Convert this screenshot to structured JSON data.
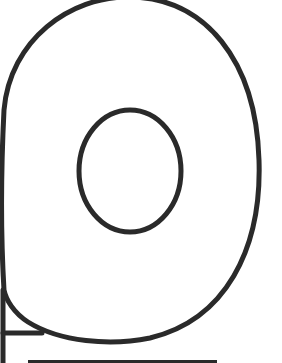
{
  "figure": {
    "description": "Line drawing of a tape roll: outer rounded loop with inner elliptical hole, a tangent strip at bottom-left, and a horizontal baseline",
    "stroke_color": "#2a2a2a",
    "background_color": "#ffffff",
    "stroke_width": 5,
    "outer_loop": {
      "top_y": -2,
      "right_x": 260,
      "bottom_y": 341,
      "left_x": 3
    },
    "inner_hole": {
      "cx": 130,
      "cy": 171,
      "rx": 52,
      "ry": 62
    },
    "left_vertical_line": {
      "x": 3,
      "y1": 100,
      "y2": 363
    },
    "tape_strip_line": {
      "x1": 3,
      "y1": 333,
      "x2": 40,
      "y2": 333
    },
    "baseline": {
      "x1": 28,
      "y1": 361,
      "x2": 217,
      "y2": 361
    }
  }
}
